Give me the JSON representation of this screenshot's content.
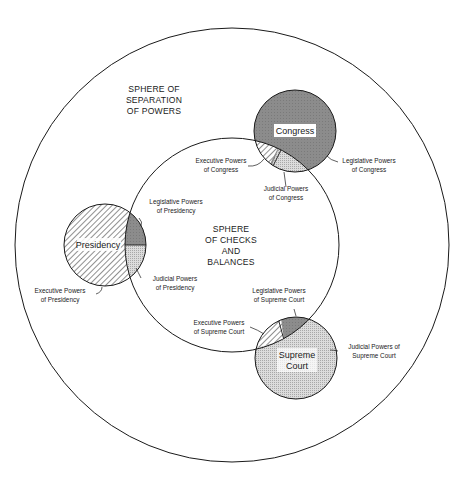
{
  "diagram": {
    "outer_sphere": {
      "lines": [
        "SPHERE OF",
        "SEPARATION",
        "OF POWERS"
      ]
    },
    "inner_sphere": {
      "lines": [
        "SPHERE",
        "OF CHECKS",
        "AND",
        "BALANCES"
      ]
    },
    "branches": {
      "congress": {
        "name": "Congress",
        "labels": {
          "executive": [
            "Executive Powers",
            "of Congress"
          ],
          "legislative": [
            "Legislative Powers",
            "of Congress"
          ],
          "judicial": [
            "Judicial Powers",
            "of Congress"
          ]
        }
      },
      "presidency": {
        "name": "Presidency",
        "labels": {
          "executive": [
            "Executive Powers",
            "of Presidency"
          ],
          "legislative": [
            "Legislative Powers",
            "of Presidency"
          ],
          "judicial": [
            "Judicial Powers",
            "of Presidency"
          ]
        }
      },
      "supreme_court": {
        "name_lines": [
          "Supreme",
          "Court"
        ],
        "labels": {
          "executive": [
            "Executive Powers",
            "of Supreme Court"
          ],
          "legislative": [
            "Legislative Powers",
            "of Supreme Court"
          ],
          "judicial": [
            "Judicial Powers of",
            "Supreme Court"
          ]
        }
      }
    },
    "colors": {
      "line": "#1a1a1a",
      "legislative_fill": "#8a8a8a",
      "judicial_fill": "#d6d6d6",
      "executive_hatch": "#333333",
      "background": "#ffffff"
    }
  }
}
